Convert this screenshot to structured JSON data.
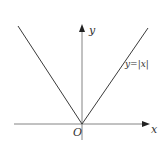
{
  "diagram": {
    "type": "function-graph",
    "function_label": "y=|x|",
    "axes": {
      "x_label": "x",
      "y_label": "y",
      "origin_label": "O"
    },
    "colors": {
      "line": "#3a3a3a",
      "axis": "#555555",
      "background": "#ffffff"
    }
  }
}
